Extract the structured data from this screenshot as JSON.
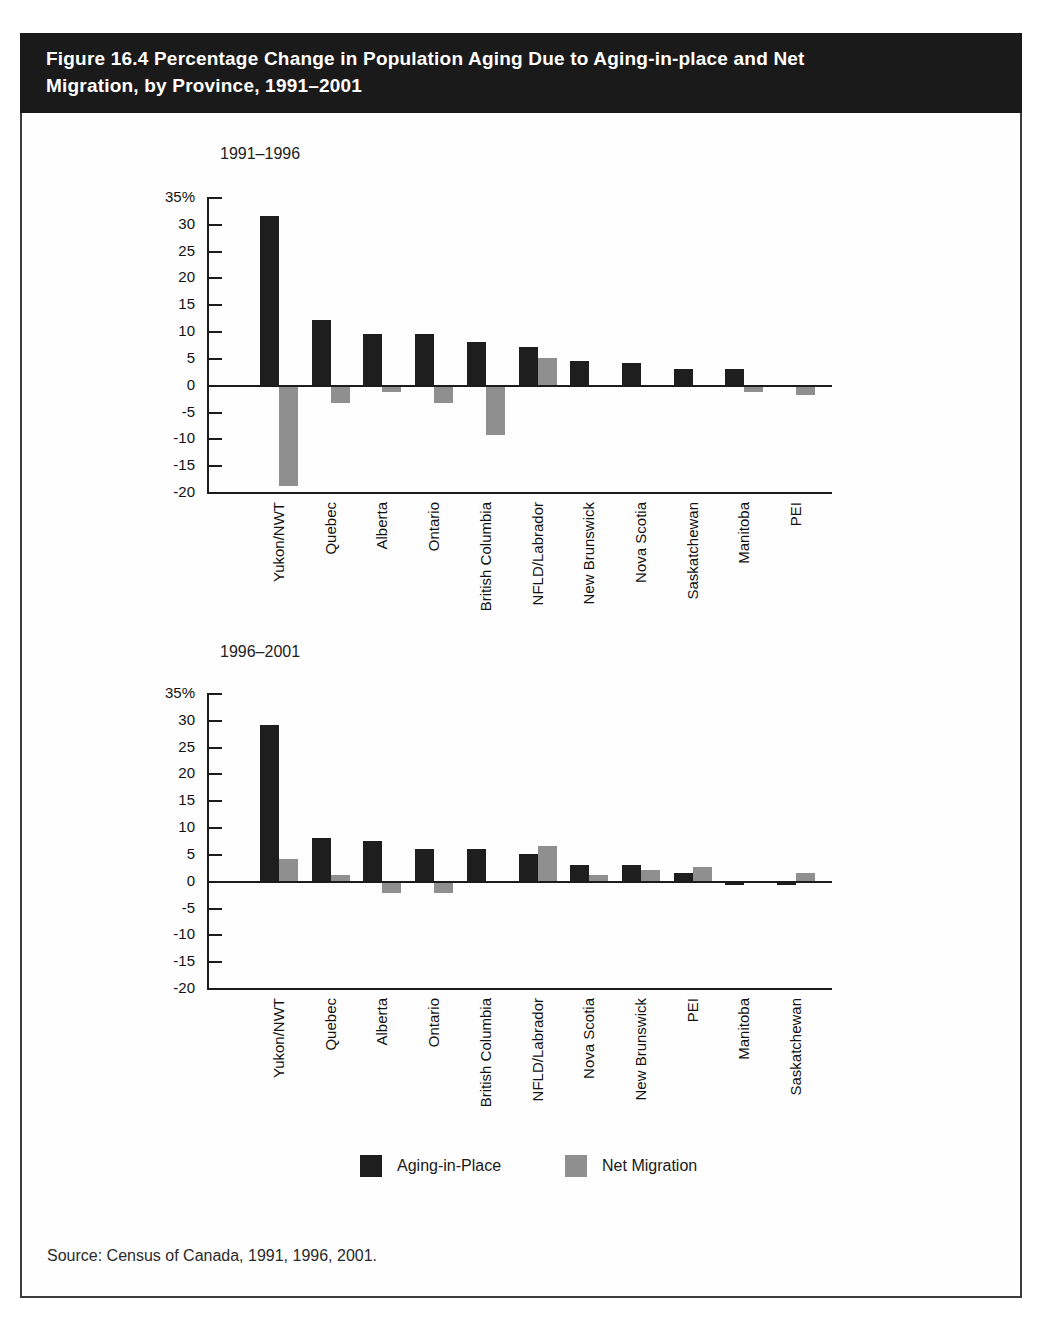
{
  "page": {
    "title_line1": "Figure 16.4 Percentage Change in Population Aging Due to Aging-in-place and Net",
    "title_line2": "Migration, by Province, 1991–2001",
    "source": "Source: Census of Canada, 1991, 1996, 2001."
  },
  "legend": {
    "items": [
      {
        "label": "Aging-in-Place",
        "color": "#1e1e1e"
      },
      {
        "label": "Net Migration",
        "color": "#8f8f8f"
      }
    ]
  },
  "colors": {
    "aging_in_place": "#1e1e1e",
    "net_migration": "#8f8f8f",
    "title_bar_bg": "#1a1a1a",
    "title_bar_text": "#ffffff",
    "axis": "#1c1c1c"
  },
  "chart_data": [
    {
      "type": "bar",
      "title": "1991–1996",
      "categories": [
        "Yukon/NWT",
        "Quebec",
        "Alberta",
        "Ontario",
        "British Columbia",
        "NFLD/Labrador",
        "New Brunswick",
        "Nova Scotia",
        "Saskatchewan",
        "Manitoba",
        "PEI"
      ],
      "series": [
        {
          "name": "Aging-in-Place",
          "color": "#1e1e1e",
          "values": [
            31.5,
            12,
            9.5,
            9.5,
            8,
            7,
            4.5,
            4,
            3,
            3,
            0
          ]
        },
        {
          "name": "Net Migration",
          "color": "#8f8f8f",
          "values": [
            -18.5,
            -3,
            -1,
            -3,
            -9,
            5,
            0,
            0,
            0,
            -1,
            -1.5
          ]
        }
      ],
      "xlabel": "",
      "ylabel": "%",
      "ylim": [
        -20,
        35
      ],
      "ytick_step": 5,
      "ytick_labels": [
        "35%",
        "30",
        "25",
        "20",
        "15",
        "10",
        "5",
        "0",
        "-5",
        "-10",
        "-15",
        "-20"
      ],
      "grid": false,
      "legend_position": "below-both-charts"
    },
    {
      "type": "bar",
      "title": "1996–2001",
      "categories": [
        "Yukon/NWT",
        "Quebec",
        "Alberta",
        "Ontario",
        "British Columbia",
        "NFLD/Labrador",
        "Nova Scotia",
        "New Brunswick",
        "PEI",
        "Manitoba",
        "Saskatchewan"
      ],
      "series": [
        {
          "name": "Aging-in-Place",
          "color": "#1e1e1e",
          "values": [
            29,
            8,
            7.5,
            6,
            6,
            5,
            3,
            3,
            1.5,
            -0.5,
            -0.5
          ]
        },
        {
          "name": "Net Migration",
          "color": "#8f8f8f",
          "values": [
            4,
            1,
            -2,
            -2,
            0,
            6.5,
            1,
            2,
            2.5,
            0,
            1.5
          ]
        }
      ],
      "xlabel": "",
      "ylabel": "%",
      "ylim": [
        -20,
        35
      ],
      "ytick_step": 5,
      "ytick_labels": [
        "35%",
        "30",
        "25",
        "20",
        "15",
        "10",
        "5",
        "0",
        "-5",
        "-10",
        "-15",
        "-20"
      ],
      "grid": false,
      "legend_position": "below-both-charts"
    }
  ]
}
